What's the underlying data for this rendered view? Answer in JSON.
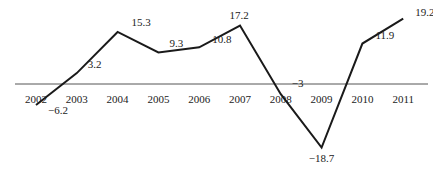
{
  "chart_data": {
    "type": "line",
    "title": "",
    "xlabel": "",
    "ylabel": "",
    "categories": [
      "2002",
      "2003",
      "2004",
      "2005",
      "2006",
      "2007",
      "2008",
      "2009",
      "2010",
      "2011"
    ],
    "values": [
      -6.2,
      3.2,
      15.3,
      9.3,
      10.8,
      17.2,
      -3,
      -18.7,
      11.9,
      19.2
    ],
    "value_labels": [
      "−6.2",
      "3.2",
      "15.3",
      "9.3",
      "10.8",
      "17.2",
      "−3",
      "−18.7",
      "11.9",
      "19.2"
    ],
    "grid": false,
    "legend": null,
    "baseline": 0,
    "colors": {
      "line": "#1a1a1a",
      "axis": "#555555",
      "text": "#222222"
    }
  }
}
